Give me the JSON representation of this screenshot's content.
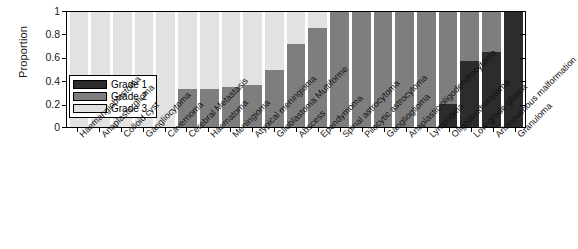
{
  "chart_data": {
    "type": "bar",
    "stacked": true,
    "title": "",
    "xlabel": "",
    "ylabel": "Proportion",
    "ylim": [
      0,
      1
    ],
    "yticks": [
      "0",
      "0.2",
      "0.4",
      "0.6",
      "0.8",
      "1"
    ],
    "grid": false,
    "legend_position": "inside-lower-left",
    "legend": [
      "Grade 1",
      "Grade 2",
      "Grade 3"
    ],
    "colors": {
      "Grade 1": "#2c2c2c",
      "Grade 2": "#7e7e7e",
      "Grade 3": "#e2e2e2",
      "axis": "#000000",
      "background": "#ffffff"
    },
    "categories": [
      "Haemangioblastoma",
      "Anaplastic glioma",
      "Colloid cyst",
      "Gangliocytoma",
      "Cavernoma",
      "Cerebral Metastasis",
      "Haematoma",
      "Meningioma",
      "Atypical meningioma",
      "Glioblastoma Multiforme",
      "Abscess",
      "Ependymoma",
      "Spinal astrocytoma",
      "Pilocytic astrocytoma",
      "Ganglioglioma",
      "Anaplastic oligodendrocytoma",
      "Lymphoma",
      "Oligodendrocytoma",
      "Low-grade glioma",
      "Arteriovenous malformation",
      "Granuloma"
    ],
    "series": [
      {
        "name": "Grade 1",
        "values": [
          0,
          0,
          0,
          0,
          0,
          0,
          0,
          0,
          0,
          0,
          0,
          0,
          0,
          0,
          0,
          0,
          0,
          0.2,
          0.57,
          0.65,
          1
        ]
      },
      {
        "name": "Grade 2",
        "values": [
          0,
          0,
          0,
          0,
          0,
          0.33,
          0.33,
          0.345,
          0.365,
          0.5,
          0.72,
          0.86,
          1,
          1,
          1,
          1,
          1,
          0.8,
          0.43,
          0.35,
          0
        ]
      },
      {
        "name": "Grade 3",
        "values": [
          1,
          1,
          1,
          1,
          1,
          0.67,
          0.67,
          0.655,
          0.635,
          0.5,
          0.28,
          0.14,
          0,
          0,
          0,
          0,
          0,
          0,
          0,
          0,
          0
        ]
      }
    ]
  }
}
